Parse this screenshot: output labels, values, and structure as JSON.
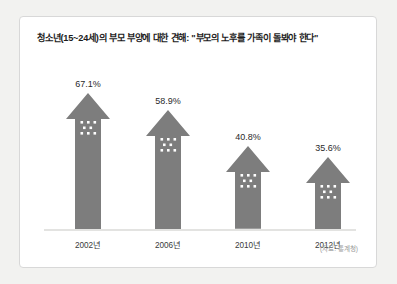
{
  "page": {
    "background_color": "#f2f2f0",
    "card_background": "#ffffff",
    "card_border_color": "#d8d8d8"
  },
  "chart_data": {
    "type": "bar",
    "title": "청소년(15~24세)의 부모 부양에 대한 견해: \"부모의 노후를 가족이 돌봐야 한다\"",
    "categories": [
      "2002년",
      "2006년",
      "2010년",
      "2012년"
    ],
    "values": [
      67.1,
      58.9,
      40.8,
      35.6
    ],
    "value_labels": [
      "67.1%",
      "58.9%",
      "40.8%",
      "35.6%"
    ],
    "xlabel": "",
    "ylabel": "",
    "ylim": [
      0,
      75
    ],
    "grid": false,
    "legend": null,
    "series_color": "#7d7d7d",
    "marker_dot_color": "#ffffff",
    "source_note": "(자료: 통계청)"
  }
}
